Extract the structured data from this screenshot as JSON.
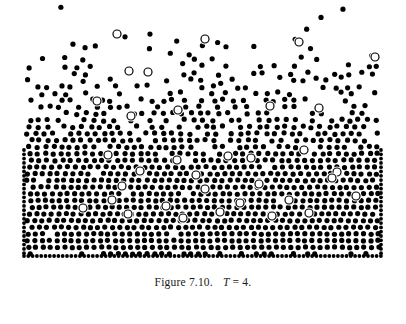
{
  "figure": {
    "caption_label": "Figure 7.10.",
    "caption_symbol": "T",
    "caption_relation": "= 4.",
    "caption_full": "Figure 7.10.   T = 4."
  },
  "chart_data": {
    "type": "scatter",
    "subtitle": "",
    "xlabel": "",
    "ylabel": "",
    "grid": false,
    "legend": null,
    "xlim": [
      0,
      406
    ],
    "ylim": [
      0,
      268
    ],
    "background": "#ffffff",
    "annotations": [
      {
        "text": "Figure 7.10.",
        "x": 203,
        "y": 285
      },
      {
        "text": "T = 4.",
        "x": 246,
        "y": 285
      }
    ],
    "geometry": {
      "box_left": 22,
      "box_right": 383,
      "box_bottom": 258,
      "box_top": 0,
      "wall_dot_radius": 1.9,
      "wall_spacing": 4.3,
      "particle_radius": 2.6,
      "tracer_radius": 4.0,
      "tracer_stroke_width": 1.2
    },
    "colors": {
      "particle_fill": "#000000",
      "tracer_fill": "#ffffff",
      "tracer_stroke": "#000000",
      "wall_fill": "#000000",
      "caption_text": "#1a1a1a",
      "background": "#ffffff"
    },
    "series": [
      {
        "name": "wall-particles",
        "marker": "filled-circle",
        "radius": 1.9,
        "color": "#000000",
        "description": "tightly packed boundary particles forming left, right and bottom container walls",
        "points_rule": {
          "left_wall_x": 24,
          "right_wall_x": 381,
          "bottom_wall_y": 256,
          "vertical_from_y": 150,
          "vertical_to_y": 256,
          "spacing": 4.3
        }
      },
      {
        "name": "fluid-particles",
        "marker": "filled-circle",
        "radius": 2.6,
        "color": "#000000",
        "count": 760,
        "description": "gas-liquid coexistence: density increases downward, dense ordered liquid near bottom, dilute vapour above",
        "density_profile": [
          {
            "y": 10,
            "relative_density": 0.02
          },
          {
            "y": 30,
            "relative_density": 0.07
          },
          {
            "y": 50,
            "relative_density": 0.16
          },
          {
            "y": 70,
            "relative_density": 0.3
          },
          {
            "y": 90,
            "relative_density": 0.48
          },
          {
            "y": 110,
            "relative_density": 0.66
          },
          {
            "y": 130,
            "relative_density": 0.8
          },
          {
            "y": 150,
            "relative_density": 0.9
          },
          {
            "y": 170,
            "relative_density": 0.95
          },
          {
            "y": 190,
            "relative_density": 0.98
          },
          {
            "y": 210,
            "relative_density": 1.0
          },
          {
            "y": 230,
            "relative_density": 1.0
          },
          {
            "y": 250,
            "relative_density": 1.0
          }
        ]
      },
      {
        "name": "tracer-particles",
        "marker": "open-circle",
        "radius": 4.0,
        "fill": "#ffffff",
        "stroke": "#000000",
        "count": 34,
        "description": "hollow tagged particles used to follow individual trajectories",
        "points": [
          [
            117,
            34
          ],
          [
            205,
            39
          ],
          [
            299,
            42
          ],
          [
            129,
            71
          ],
          [
            148,
            72
          ],
          [
            375,
            57
          ],
          [
            97,
            101
          ],
          [
            131,
            116
          ],
          [
            178,
            110
          ],
          [
            270,
            106
          ],
          [
            319,
            108
          ],
          [
            108,
            155
          ],
          [
            177,
            160
          ],
          [
            228,
            156
          ],
          [
            251,
            158
          ],
          [
            304,
            150
          ],
          [
            140,
            171
          ],
          [
            196,
            175
          ],
          [
            337,
            172
          ],
          [
            122,
            186
          ],
          [
            205,
            189
          ],
          [
            259,
            184
          ],
          [
            332,
            178
          ],
          [
            112,
            200
          ],
          [
            166,
            206
          ],
          [
            240,
            203
          ],
          [
            289,
            200
          ],
          [
            356,
            196
          ],
          [
            128,
            214
          ],
          [
            183,
            218
          ],
          [
            220,
            212
          ],
          [
            272,
            216
          ],
          [
            309,
            213
          ],
          [
            83,
            208
          ]
        ]
      }
    ]
  }
}
